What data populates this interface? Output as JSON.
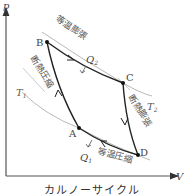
{
  "diagram": {
    "title": "カルノーサイクル",
    "axes": {
      "x_label": "V",
      "y_label": "p"
    },
    "points": [
      {
        "id": "A",
        "label": "A"
      },
      {
        "id": "B",
        "label": "B"
      },
      {
        "id": "C",
        "label": "C"
      },
      {
        "id": "D",
        "label": "D"
      }
    ],
    "processes": {
      "BC": "等温膨張",
      "CD": "断熱膨張",
      "DA": "等温圧縮",
      "AB": "断熱圧縮"
    },
    "heat": {
      "Q2": "Q",
      "Q2_sub": "2",
      "Q1": "Q",
      "Q1_sub": "1"
    },
    "isotherms": {
      "T1": "T",
      "T1_sub": "1",
      "T2": "T",
      "T2_sub": "2"
    },
    "colors": {
      "cycle": "#222222",
      "isotherm": "#888888",
      "axis": "#333333",
      "text": "#555555"
    }
  }
}
